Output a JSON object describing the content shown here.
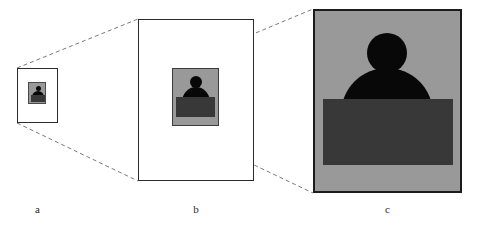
{
  "figure": {
    "background_color": "#ffffff",
    "width": 478,
    "height": 232
  },
  "colors": {
    "page_background": "#ffffff",
    "panel_border": "#2b2b2b",
    "panel_c_border": "#1c1c1c",
    "photo_background": "#999999",
    "figure_silhouette": "#080808",
    "desk_rectangle": "#383838",
    "connector_line": "#6b6b6b",
    "caption_text": "#2b2b2b"
  },
  "panels": [
    {
      "id": "a",
      "caption": "a",
      "role": "smallest-scale-view",
      "frame": {
        "x": 17,
        "y": 68,
        "width": 41,
        "height": 55
      },
      "photo": {
        "x": 28,
        "y": 82,
        "width": 18,
        "height": 22
      },
      "contents": [
        "head-circle",
        "shoulders-semicircle",
        "desk-rectangle"
      ]
    },
    {
      "id": "b",
      "caption": "b",
      "role": "intermediate-scale-view",
      "frame": {
        "x": 138,
        "y": 19,
        "width": 116,
        "height": 162
      },
      "photo": {
        "x": 172,
        "y": 68,
        "width": 47,
        "height": 58
      },
      "contents": [
        "head-circle",
        "shoulders-semicircle",
        "desk-rectangle"
      ]
    },
    {
      "id": "c",
      "caption": "c",
      "role": "largest-scale-view",
      "frame": {
        "x": 313,
        "y": 9,
        "width": 149,
        "height": 184
      },
      "photo": {
        "x": 315,
        "y": 11,
        "width": 145,
        "height": 180
      },
      "contents": [
        "head-circle",
        "shoulders-semicircle",
        "desk-rectangle"
      ]
    }
  ],
  "connectors": [
    {
      "name": "a-to-b-top",
      "from": {
        "x": 17,
        "y": 68
      },
      "to": {
        "x": 138,
        "y": 19
      },
      "style": "dashed"
    },
    {
      "name": "a-to-b-bottom",
      "from": {
        "x": 17,
        "y": 123
      },
      "to": {
        "x": 138,
        "y": 181
      },
      "style": "dashed"
    },
    {
      "name": "b-to-c-top",
      "from": {
        "x": 172,
        "y": 68
      },
      "to": {
        "x": 313,
        "y": 9
      },
      "style": "dashed"
    },
    {
      "name": "b-to-c-bottom",
      "from": {
        "x": 172,
        "y": 126
      },
      "to": {
        "x": 313,
        "y": 193
      },
      "style": "dashed"
    }
  ]
}
